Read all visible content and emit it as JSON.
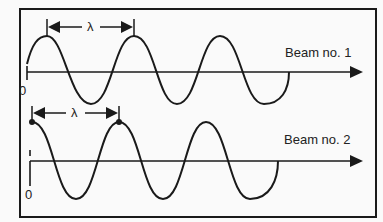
{
  "figure": {
    "beam1": {
      "label": "Beam no. 1",
      "origin_label": "0",
      "wavelength_label": "λ"
    },
    "beam2": {
      "label": "Beam no. 2",
      "origin_label": "0",
      "wavelength_label": "λ"
    },
    "colors": {
      "stroke": "#1a1a1a",
      "background": "#fafafa"
    }
  }
}
